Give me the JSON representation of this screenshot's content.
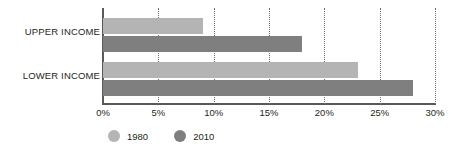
{
  "chart_data": {
    "type": "bar",
    "orientation": "horizontal",
    "title": "",
    "subtitle": "",
    "xlabel": "",
    "ylabel": "",
    "categories": [
      "UPPER INCOME",
      "LOWER INCOME"
    ],
    "series": [
      {
        "name": "1980",
        "color": "#b4b4b4",
        "values": [
          9,
          23
        ]
      },
      {
        "name": "2010",
        "color": "#7f7f7f",
        "values": [
          18,
          28
        ]
      }
    ],
    "xlim": [
      0,
      30
    ],
    "xticks": [
      0,
      5,
      10,
      15,
      20,
      25,
      30
    ],
    "xtick_labels": [
      "0%",
      "5%",
      "10%",
      "15%",
      "20%",
      "25%",
      "30%"
    ],
    "grid": true,
    "grid_axis": "x",
    "grid_style": "dotted",
    "legend_position": "bottom-left",
    "value_format": "percent",
    "annotations": []
  },
  "legend": {
    "entries": [
      {
        "label": "1980",
        "color": "#b4b4b4"
      },
      {
        "label": "2010",
        "color": "#7f7f7f"
      }
    ]
  },
  "axis": {
    "tick_labels": [
      "0%",
      "5%",
      "10%",
      "15%",
      "20%",
      "25%",
      "30%"
    ]
  },
  "categories": {
    "upper": "UPPER INCOME",
    "lower": "LOWER INCOME"
  },
  "colors": {
    "series_1980": "#b4b4b4",
    "series_2010": "#7f7f7f",
    "axis": "#58595b",
    "grid": "#6d6e71",
    "text": "#231f20",
    "background": "#ffffff"
  }
}
